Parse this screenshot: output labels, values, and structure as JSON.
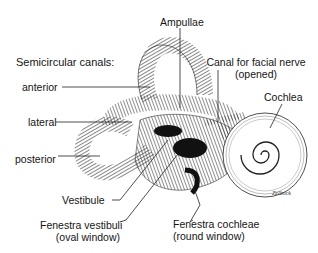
{
  "diagram": {
    "heading": "Semicircular canals:",
    "labels": {
      "anterior": "anterior",
      "lateral": "lateral",
      "posterior": "posterior",
      "ampullae": "Ampullae",
      "facial_canal_1": "Canal for facial nerve",
      "facial_canal_2": "(opened)",
      "cochlea": "Cochlea",
      "vestibule": "Vestibule",
      "fenestra_vestibuli_1": "Fenestra vestibuli",
      "fenestra_vestibuli_2": "(oval window)",
      "fenestra_cochleae_1": "Fenestra cochleae",
      "fenestra_cochleae_2": "(round window)"
    },
    "signature": "Zelbock",
    "colors": {
      "ink": "#111111",
      "background": "#ffffff"
    }
  }
}
